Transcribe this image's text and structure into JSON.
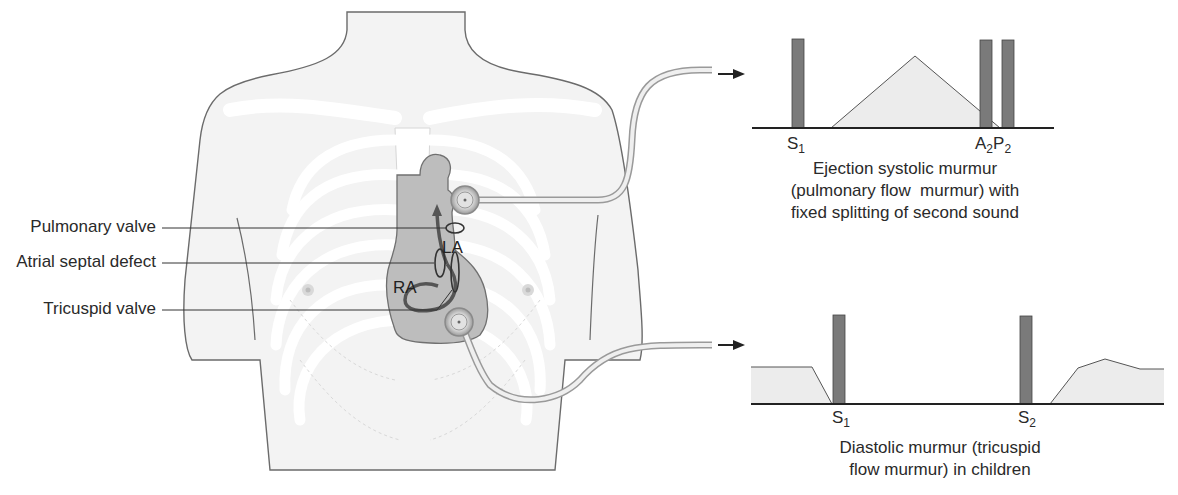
{
  "labels": {
    "pulmonary_valve": "Pulmonary valve",
    "atrial_septal_defect": "Atrial septal defect",
    "tricuspid_valve": "Tricuspid valve",
    "la": "LA",
    "ra": "RA"
  },
  "top_panel": {
    "s1": "S",
    "s1_sub": "1",
    "a2": "A",
    "a2_sub": "2",
    "p2": "P",
    "p2_sub": "2",
    "caption_line1": "Ejection systolic murmur",
    "caption_line2": "(pulmonary flow  murmur) with",
    "caption_line3": "fixed splitting of second sound"
  },
  "bottom_panel": {
    "s1": "S",
    "s1_sub": "1",
    "s2": "S",
    "s2_sub": "2",
    "caption_line1": "Diastolic murmur (tricuspid",
    "caption_line2": "flow murmur) in children"
  },
  "colors": {
    "bar": "#7a7a7a",
    "murmur_fill": "#ececec",
    "heart": "#b9b9b9",
    "body_fill": "#f2f2f2",
    "outline": "#555555"
  }
}
